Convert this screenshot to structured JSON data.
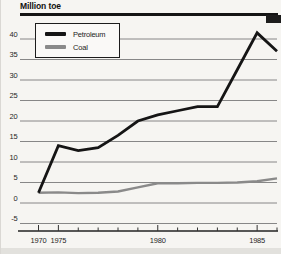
{
  "chart_data": {
    "type": "line",
    "title": "Million toe",
    "categories": [
      1970,
      1975,
      1976,
      1977,
      1978,
      1979,
      1980,
      1981,
      1982,
      1983,
      1984,
      1985,
      1986
    ],
    "x_tick_labels": [
      "1970",
      "1975",
      "1980",
      "1985"
    ],
    "y_ticks": [
      40,
      35,
      30,
      25,
      20,
      15,
      10,
      5,
      0,
      -5
    ],
    "ylim": [
      -5,
      40
    ],
    "grid": true,
    "legend_position": "top-left",
    "x_axis_note": "1970 plotted adjacent to 1975; yearly from 1975 to 1986",
    "series": [
      {
        "name": "Petroleum",
        "color": "#151515",
        "values": [
          2.5,
          14,
          12.8,
          13.5,
          16.5,
          20,
          21.5,
          22.5,
          23.5,
          23.5,
          32.5,
          41.5,
          37
        ]
      },
      {
        "name": "Coal",
        "color": "#8a8a8a",
        "values": [
          2.5,
          2.6,
          2.4,
          2.5,
          2.8,
          3.8,
          4.8,
          4.8,
          4.9,
          4.9,
          5.0,
          5.3,
          6.0
        ]
      }
    ]
  }
}
